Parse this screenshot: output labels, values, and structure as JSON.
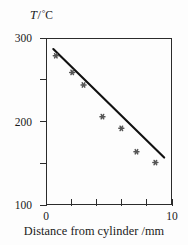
{
  "chart_data": {
    "type": "scatter",
    "title": "",
    "subtitle": "",
    "xlabel": "Distance from cylinder /mm",
    "ylabel": "T /°C",
    "ylabel_parts": {
      "quantity": "T",
      "solidus": "/",
      "degree": "°",
      "unit": "C"
    },
    "xlim": [
      0,
      10
    ],
    "ylim": [
      100,
      300
    ],
    "grid": false,
    "legend": null,
    "x_ticks": [
      0,
      2,
      4,
      6,
      8,
      10
    ],
    "x_tick_labels": [
      "0",
      "",
      "",
      "",
      "",
      "10"
    ],
    "y_ticks": [
      100,
      150,
      200,
      250,
      300
    ],
    "y_tick_labels": [
      "100",
      "",
      "200",
      "",
      "300"
    ],
    "marker_style": "asterisk",
    "marker_color": "#555555",
    "line_color": "#111111",
    "frame_color": "#2b2b2b",
    "points": [
      {
        "x": 0.7,
        "y": 280
      },
      {
        "x": 2.0,
        "y": 260
      },
      {
        "x": 2.9,
        "y": 245
      },
      {
        "x": 4.4,
        "y": 207
      },
      {
        "x": 5.9,
        "y": 193
      },
      {
        "x": 7.1,
        "y": 165
      },
      {
        "x": 8.6,
        "y": 152
      }
    ],
    "fit_line": {
      "x_start": 0.5,
      "y_start": 288,
      "x_end": 9.3,
      "y_end": 158,
      "slope": -14.8,
      "intercept": 295.4
    }
  },
  "axes": {
    "y_caption": {
      "quantity": "T",
      "solidus": "/",
      "degree": "°",
      "unit": "C"
    },
    "x_caption": "Distance from cylinder /mm"
  }
}
